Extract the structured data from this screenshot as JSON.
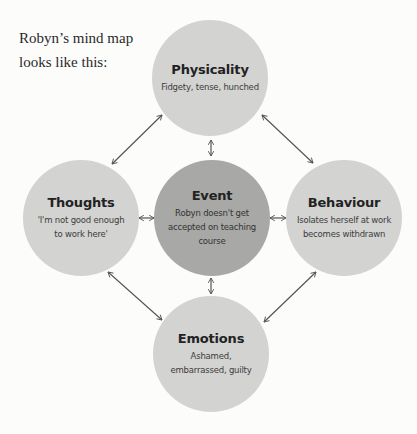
{
  "intro": {
    "text": "Robyn’s mind map looks like this:"
  },
  "colors": {
    "background": "#fcfcfb",
    "outer_node": "#d3d3d2",
    "center_node": "#a8a8a7",
    "arrow": "#555555"
  },
  "nodes": {
    "physicality": {
      "title": "Physicality",
      "text": "Fidgety, tense, hunched"
    },
    "thoughts": {
      "title": "Thoughts",
      "text": "'I'm not good enough to work here'"
    },
    "event": {
      "title": "Event",
      "text": "Robyn doesn't get accepted on teaching course"
    },
    "behaviour": {
      "title": "Behaviour",
      "text": "Isolates herself at work becomes withdrawn"
    },
    "emotions": {
      "title": "Emotions",
      "text": "Ashamed, embarrassed, guilty"
    }
  },
  "connections": [
    {
      "from": "physicality",
      "to": "thoughts",
      "type": "bidirectional"
    },
    {
      "from": "physicality",
      "to": "behaviour",
      "type": "bidirectional"
    },
    {
      "from": "physicality",
      "to": "event",
      "type": "bidirectional"
    },
    {
      "from": "thoughts",
      "to": "event",
      "type": "bidirectional"
    },
    {
      "from": "event",
      "to": "behaviour",
      "type": "bidirectional"
    },
    {
      "from": "event",
      "to": "emotions",
      "type": "bidirectional"
    },
    {
      "from": "thoughts",
      "to": "emotions",
      "type": "bidirectional"
    },
    {
      "from": "behaviour",
      "to": "emotions",
      "type": "bidirectional"
    }
  ]
}
